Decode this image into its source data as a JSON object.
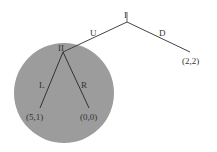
{
  "diagram": {
    "type": "game-tree",
    "subgame_highlight_color": "#9c9c9c",
    "line_color": "#444444",
    "nodes": [
      {
        "id": "I",
        "label": "I",
        "x": 127,
        "y": 22
      },
      {
        "id": "II",
        "label": "II",
        "x": 63,
        "y": 52
      }
    ],
    "edges": [
      {
        "from": "I",
        "to": "II",
        "label": "U"
      },
      {
        "from": "I",
        "to": "payoff_D",
        "label": "D"
      },
      {
        "from": "II",
        "to": "payoff_L",
        "label": "L"
      },
      {
        "from": "II",
        "to": "payoff_R",
        "label": "R"
      }
    ],
    "payoffs": {
      "D": "(2,2)",
      "L": "(5,1)",
      "R": "(0,0)"
    },
    "labels": {
      "node_I": "I",
      "node_II": "II",
      "edge_U": "U",
      "edge_D": "D",
      "edge_L": "L",
      "edge_R": "R"
    },
    "subgame": {
      "circle_center_x": 64,
      "circle_center_y": 93,
      "radius": 50,
      "contains": "II"
    }
  }
}
